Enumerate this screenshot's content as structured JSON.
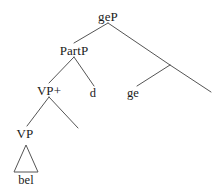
{
  "figure": {
    "kind": "syntax-tree",
    "title": "",
    "background_color": "#ffffff",
    "line_color": "#555555",
    "text_color": "#1a1a1a",
    "width": 216,
    "height": 189
  },
  "nodes": {
    "root": {
      "label": "geP",
      "x": 108,
      "y": 16
    },
    "partp": {
      "label": "PartP",
      "x": 74,
      "y": 50
    },
    "vpplus": {
      "label": "VP+",
      "x": 49,
      "y": 90
    },
    "d": {
      "label": "d",
      "x": 93,
      "y": 93
    },
    "ge": {
      "label": "ge",
      "x": 133,
      "y": 93
    },
    "vp": {
      "label": "VP",
      "x": 25,
      "y": 133
    },
    "bel": {
      "label": "bel",
      "x": 26,
      "y": 180
    }
  },
  "edges": [
    {
      "name": "geP-to-PartP",
      "x1": 108,
      "y1": 23,
      "x2": 74,
      "y2": 43
    },
    {
      "name": "geP-to-right-branch",
      "x1": 108,
      "y1": 23,
      "x2": 170,
      "y2": 65
    },
    {
      "name": "right-branch-to-ge",
      "x1": 170,
      "y1": 65,
      "x2": 137,
      "y2": 86
    },
    {
      "name": "right-branch-to-empty",
      "x1": 170,
      "y1": 65,
      "x2": 211,
      "y2": 92
    },
    {
      "name": "PartP-to-VPplus",
      "x1": 74,
      "y1": 57,
      "x2": 49,
      "y2": 83
    },
    {
      "name": "PartP-to-d",
      "x1": 74,
      "y1": 57,
      "x2": 94,
      "y2": 86
    },
    {
      "name": "VPplus-to-VP",
      "x1": 49,
      "y1": 97,
      "x2": 27,
      "y2": 126
    },
    {
      "name": "VPplus-to-empty",
      "x1": 49,
      "y1": 97,
      "x2": 78,
      "y2": 128
    }
  ],
  "triangle": {
    "name": "bel-triangle",
    "apex_x": 26,
    "apex_y": 145,
    "left_x": 14,
    "right_x": 38,
    "base_y": 172
  }
}
